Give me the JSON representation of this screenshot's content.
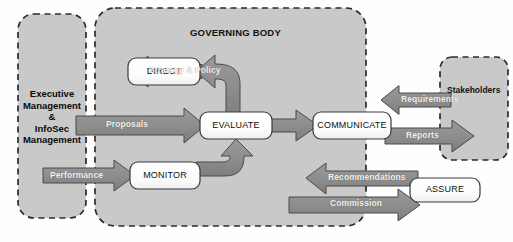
{
  "figure": {
    "caption_left": "",
    "caption_right": ""
  },
  "zones": [
    {
      "id": "executive",
      "name": "executive-management-zone",
      "label": "Executive\nManagement\n&\nInfoSec\nManagement",
      "lines": [
        "Executive",
        "Management",
        "&",
        "InfoSec",
        "Management"
      ],
      "x": 18,
      "y": 14,
      "w": 68,
      "h": 204,
      "fill": "#c9c9c9",
      "border": "#2b2b2b",
      "style": "dashed"
    },
    {
      "id": "governing",
      "name": "governing-body-zone",
      "label": "GOVERNING BODY",
      "x": 95,
      "y": 8,
      "w": 271,
      "h": 218,
      "fill": "#c9c9c9",
      "border": "#2b2b2b",
      "style": "dashed"
    },
    {
      "id": "stakeholders",
      "name": "stakeholders-zone",
      "label": "Stakeholders",
      "x": 440,
      "y": 57,
      "w": 68,
      "h": 103,
      "fill": "#c9c9c9",
      "border": "#2b2b2b",
      "style": "dashed"
    }
  ],
  "processes": [
    {
      "id": "direct",
      "label": "DIRECT",
      "x": 128,
      "y": 58,
      "w": 72,
      "h": 27
    },
    {
      "id": "evaluate",
      "label": "EVALUATE",
      "x": 200,
      "y": 112,
      "w": 72,
      "h": 27
    },
    {
      "id": "monitor",
      "label": "MONITOR",
      "x": 130,
      "y": 162,
      "w": 70,
      "h": 27
    },
    {
      "id": "communicate",
      "label": "COMMUNICATE",
      "x": 313,
      "y": 112,
      "w": 78,
      "h": 27
    },
    {
      "id": "assure",
      "label": "ASSURE",
      "x": 410,
      "y": 178,
      "w": 70,
      "h": 24
    }
  ],
  "flows": [
    {
      "id": "strategy",
      "label": "Strategy & Policy",
      "direction": "left"
    },
    {
      "id": "proposals",
      "label": "Proposals",
      "direction": "right"
    },
    {
      "id": "performance",
      "label": "Performance",
      "direction": "right"
    },
    {
      "id": "requirements",
      "label": "Requirements",
      "direction": "left"
    },
    {
      "id": "reports",
      "label": "Reports",
      "direction": "right"
    },
    {
      "id": "recommendations",
      "label": "Recommendations",
      "direction": "left"
    },
    {
      "id": "commission",
      "label": "Commission",
      "direction": "right"
    },
    {
      "id": "evaluate-to-communicate",
      "label": "",
      "direction": "right"
    },
    {
      "id": "evaluate-to-direct",
      "label": "",
      "direction": "up-left"
    },
    {
      "id": "monitor-to-evaluate",
      "label": "",
      "direction": "up-left"
    }
  ],
  "colors": {
    "zone_fill": "#c9c9c9",
    "zone_border": "#2b2b2b",
    "arrow_fill": "#8c8c8c",
    "arrow_stroke": "#4a4a4a",
    "box_fill": "#fbfbfb",
    "box_stroke": "#3a3a3a",
    "page_bg": "#fefefe",
    "flow_text": "#f2f2f2",
    "label_text": "#111111"
  }
}
